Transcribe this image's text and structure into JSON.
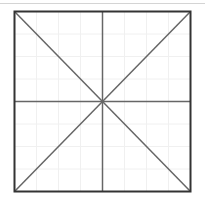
{
  "figure": {
    "square": {
      "x1": 14.5,
      "y1": 11.5,
      "x2": 190.5,
      "y2": 191.5
    },
    "colors": {
      "background": "#ffffff",
      "border": "#333333",
      "guide_lines": "#666666",
      "faint_grid": "#f0f0f0",
      "top_rule": "#d4d4d4"
    },
    "grid_divisions": 8,
    "lines": [
      {
        "name": "vertical-center-line"
      },
      {
        "name": "horizontal-center-line"
      },
      {
        "name": "diagonal-tl-br"
      },
      {
        "name": "diagonal-tr-bl"
      }
    ]
  }
}
